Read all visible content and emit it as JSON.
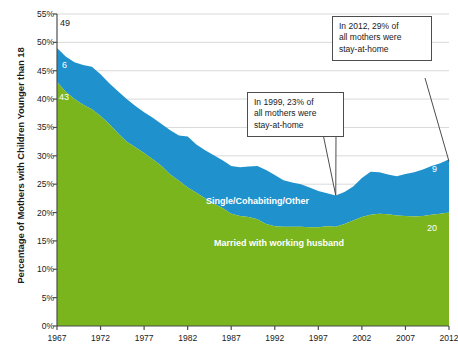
{
  "chart_data": {
    "type": "area",
    "stacked": true,
    "title": "",
    "subtitle": "",
    "xlabel": "",
    "ylabel": "Percentage of Mothers with Children Younger than 18",
    "xlim": [
      1967,
      2012
    ],
    "ylim": [
      0,
      55
    ],
    "y_tick_labels": [
      "0%",
      "5%",
      "10%",
      "15%",
      "20%",
      "25%",
      "30%",
      "35%",
      "40%",
      "45%",
      "50%",
      "55%"
    ],
    "y_tick_values": [
      0,
      5,
      10,
      15,
      20,
      25,
      30,
      35,
      40,
      45,
      50,
      55
    ],
    "x_tick_labels": [
      "1967",
      "1972",
      "1977",
      "1982",
      "1987",
      "1992",
      "1997",
      "2002",
      "2007",
      "2012"
    ],
    "x_tick_values": [
      1967,
      1972,
      1977,
      1982,
      1987,
      1992,
      1997,
      2002,
      2007,
      2012
    ],
    "grid": true,
    "legend_position": "inside",
    "x": [
      1967,
      1968,
      1969,
      1970,
      1971,
      1972,
      1973,
      1974,
      1975,
      1976,
      1977,
      1978,
      1979,
      1980,
      1981,
      1982,
      1983,
      1984,
      1985,
      1986,
      1987,
      1988,
      1989,
      1990,
      1991,
      1992,
      1993,
      1994,
      1995,
      1996,
      1997,
      1998,
      1999,
      2000,
      2001,
      2002,
      2003,
      2004,
      2005,
      2006,
      2007,
      2008,
      2009,
      2010,
      2011,
      2012
    ],
    "series": [
      {
        "name": "Married with working husband",
        "color": "#7ab51d",
        "label_color": "#ffffff",
        "values": [
          43.0,
          41.3,
          40.0,
          39.0,
          38.2,
          37.0,
          35.6,
          34.0,
          32.5,
          31.5,
          30.5,
          29.4,
          28.2,
          26.7,
          25.6,
          24.4,
          23.5,
          22.5,
          21.6,
          20.8,
          19.8,
          19.4,
          19.2,
          18.8,
          18.0,
          17.6,
          17.5,
          17.5,
          17.5,
          17.4,
          17.4,
          17.6,
          17.5,
          18.0,
          18.6,
          19.2,
          19.6,
          19.8,
          19.7,
          19.5,
          19.4,
          19.3,
          19.4,
          19.6,
          19.8,
          20.0
        ]
      },
      {
        "name": "Single/Cohabiting/Other",
        "color": "#1f92ce",
        "label_color": "#ffffff",
        "values": [
          6.0,
          6.2,
          6.5,
          7.0,
          7.5,
          7.4,
          7.2,
          7.4,
          7.5,
          7.3,
          7.2,
          7.3,
          7.4,
          7.8,
          8.0,
          9.0,
          8.5,
          8.5,
          8.5,
          8.4,
          8.4,
          8.6,
          8.9,
          9.4,
          9.5,
          9.0,
          8.2,
          7.8,
          7.5,
          7.0,
          6.4,
          5.8,
          5.5,
          5.6,
          6.0,
          6.9,
          7.6,
          7.3,
          7.0,
          6.9,
          7.4,
          7.8,
          8.2,
          8.6,
          8.9,
          9.4
        ]
      }
    ],
    "total_values": [
      49.0,
      47.5,
      46.5,
      46.0,
      45.7,
      44.4,
      42.8,
      41.4,
      40.0,
      38.8,
      37.7,
      36.7,
      35.6,
      34.5,
      33.6,
      33.4,
      32.0,
      31.0,
      30.1,
      29.2,
      28.2,
      28.0,
      28.1,
      28.2,
      27.5,
      26.6,
      25.7,
      25.3,
      25.0,
      24.4,
      23.8,
      23.4,
      23.0,
      23.6,
      24.6,
      26.1,
      27.2,
      27.1,
      26.7,
      26.4,
      26.8,
      27.1,
      27.6,
      28.2,
      28.7,
      29.4
    ],
    "endpoint_labels": [
      {
        "name": "total-1967",
        "text": "49",
        "value": 49,
        "style": "dark"
      },
      {
        "name": "blue-1967",
        "text": "6",
        "value": 6,
        "style": "light"
      },
      {
        "name": "green-1967",
        "text": "43",
        "value": 43,
        "style": "light"
      },
      {
        "name": "blue-2012",
        "text": "9",
        "value": 9,
        "style": "light"
      },
      {
        "name": "green-2012",
        "text": "20",
        "value": 20,
        "style": "light"
      }
    ],
    "annotations": [
      {
        "name": "callout-1999",
        "lines": [
          "In 1999, 23% of",
          "all mothers were",
          "stay-at-home"
        ],
        "point_year": 1999,
        "point_value": 23
      },
      {
        "name": "callout-2012",
        "lines": [
          "In 2012, 29% of",
          "all mothers were",
          "stay-at-home"
        ],
        "point_year": 2012,
        "point_value": 29
      }
    ],
    "colors": {
      "green": "#7ab51d",
      "blue": "#1f92ce",
      "gridline": "#d9d9d9",
      "axis": "#4d4d4d",
      "text": "#1a1a1a",
      "callout_border": "#4d4d4d",
      "background": "#ffffff"
    }
  }
}
